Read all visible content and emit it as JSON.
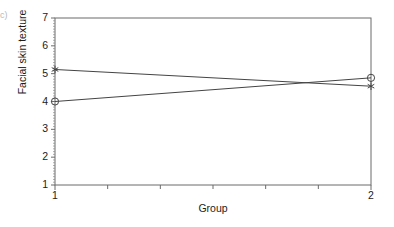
{
  "panel": {
    "label": "c)"
  },
  "chart_data": {
    "type": "line",
    "title": "",
    "subtitle": "",
    "xlabel": "Group",
    "ylabel": "Facial skin texture",
    "x": [
      1,
      2
    ],
    "xlim": [
      1,
      2
    ],
    "ylim": [
      1,
      7
    ],
    "xticks": [
      1,
      2
    ],
    "xtick_labels": [
      "1",
      "2"
    ],
    "x_minor_ticks": 5,
    "yticks": [
      1,
      2,
      3,
      4,
      5,
      6,
      7
    ],
    "ytick_labels": [
      "1",
      "2",
      "3",
      "4",
      "5",
      "6",
      "7"
    ],
    "grid": false,
    "legend": "none",
    "series": [
      {
        "name": "circle-series",
        "marker": "circle",
        "values": [
          4.0,
          4.85
        ],
        "color": "#444444"
      },
      {
        "name": "star-series",
        "marker": "star",
        "values": [
          5.15,
          4.55
        ],
        "color": "#444444"
      }
    ],
    "annotations": [
      {
        "text": "lines cross",
        "x": 1.73,
        "y": 4.68
      }
    ]
  },
  "axes": {
    "frame_color": "#6b6b6b",
    "text_color": "#1c1c1c"
  }
}
